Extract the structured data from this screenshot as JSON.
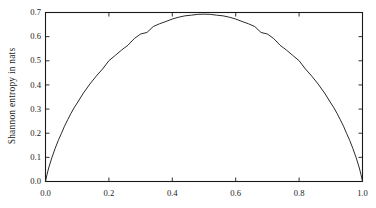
{
  "chart_data": {
    "type": "line",
    "title": "",
    "subtitle": "",
    "xlabel": "",
    "ylabel": "Shannon entropy in nats",
    "xlim": [
      0.0,
      1.0
    ],
    "ylim": [
      0.0,
      0.7
    ],
    "xticks": [
      "0.0",
      "0.2",
      "0.4",
      "0.6",
      "0.8",
      "1.0"
    ],
    "xtick_values": [
      0.0,
      0.2,
      0.4,
      0.6,
      0.8,
      1.0
    ],
    "yticks": [
      "0.0",
      "0.1",
      "0.2",
      "0.3",
      "0.4",
      "0.5",
      "0.6",
      "0.7"
    ],
    "ytick_values": [
      0.0,
      0.1,
      0.2,
      0.3,
      0.4,
      0.5,
      0.6,
      0.7
    ],
    "grid": false,
    "legend": false,
    "legend_position": "none",
    "line_color": "#2b2b2b",
    "frame_color": "#1a1a1a",
    "background": "#ffffff",
    "annotations": [],
    "series": [
      {
        "name": "binary entropy",
        "x": [
          0.0,
          0.005,
          0.01,
          0.02,
          0.03,
          0.04,
          0.05,
          0.06,
          0.07,
          0.08,
          0.09,
          0.1,
          0.12,
          0.14,
          0.16,
          0.18,
          0.2,
          0.22,
          0.24,
          0.26,
          0.28,
          0.3,
          0.32,
          0.34,
          0.36,
          0.38,
          0.4,
          0.42,
          0.44,
          0.46,
          0.48,
          0.5,
          0.52,
          0.54,
          0.56,
          0.58,
          0.6,
          0.62,
          0.64,
          0.66,
          0.68,
          0.7,
          0.72,
          0.74,
          0.76,
          0.78,
          0.8,
          0.82,
          0.84,
          0.86,
          0.88,
          0.9,
          0.91,
          0.92,
          0.93,
          0.94,
          0.95,
          0.96,
          0.97,
          0.98,
          0.99,
          0.995,
          1.0
        ],
        "y": [
          0.0,
          0.0301,
          0.056,
          0.0983,
          0.1354,
          0.1691,
          0.1985,
          0.2294,
          0.2558,
          0.2813,
          0.3046,
          0.3251,
          0.3671,
          0.4038,
          0.4365,
          0.466,
          0.5004,
          0.5222,
          0.5444,
          0.5643,
          0.592,
          0.6109,
          0.6172,
          0.642,
          0.6534,
          0.6629,
          0.673,
          0.6805,
          0.6862,
          0.689,
          0.6923,
          0.6931,
          0.6923,
          0.689,
          0.6862,
          0.6805,
          0.673,
          0.6629,
          0.6534,
          0.642,
          0.6172,
          0.6109,
          0.592,
          0.5643,
          0.5444,
          0.5222,
          0.5004,
          0.466,
          0.4365,
          0.4038,
          0.3671,
          0.3251,
          0.3046,
          0.2813,
          0.2558,
          0.2294,
          0.1985,
          0.1691,
          0.1354,
          0.0983,
          0.056,
          0.0301,
          0.0
        ]
      }
    ]
  }
}
